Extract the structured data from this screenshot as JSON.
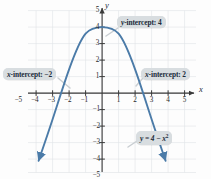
{
  "chart_data": {
    "type": "line",
    "title": "",
    "xlabel": "x",
    "ylabel": "y",
    "equation": "y = 4 − x²",
    "function": "y = 4 - x^2",
    "xlim": [
      -5.8,
      5.8
    ],
    "ylim": [
      -5.8,
      5.8
    ],
    "grid": true,
    "legend": "none",
    "x_ticks": [
      -5,
      -4,
      -3,
      -2,
      -1,
      1,
      2,
      3,
      4,
      5
    ],
    "y_ticks": [
      5,
      4,
      3,
      2,
      1,
      -1,
      -2,
      -3,
      -4,
      -5
    ],
    "x_tick_labels": [
      "−5",
      "−4",
      "−3",
      "−2",
      "−1",
      "1",
      "2",
      "3",
      "4",
      "5"
    ],
    "y_tick_labels": [
      "5",
      "4",
      "3",
      "2",
      "1",
      "−1",
      "−2",
      "−3",
      "−4",
      "−5"
    ],
    "curve_color": "#4b7ba8",
    "series": [
      {
        "name": "y = 4 - x^2",
        "x": [
          -3.1,
          -3.0,
          -2.8,
          -2.6,
          -2.4,
          -2.2,
          -2.0,
          -1.8,
          -1.6,
          -1.4,
          -1.2,
          -1.0,
          -0.8,
          -0.6,
          -0.4,
          -0.2,
          0.0,
          0.2,
          0.4,
          0.6,
          0.8,
          1.0,
          1.2,
          1.4,
          1.6,
          1.8,
          2.0,
          2.2,
          2.4,
          2.6,
          2.8,
          3.0,
          3.1
        ],
        "y": [
          -5.61,
          -5.0,
          -3.84,
          -2.76,
          -1.76,
          -0.84,
          0.0,
          0.76,
          1.44,
          2.04,
          2.56,
          3.0,
          3.36,
          3.64,
          3.84,
          3.96,
          4.0,
          3.96,
          3.84,
          3.64,
          3.36,
          3.0,
          2.56,
          2.04,
          1.44,
          0.76,
          0.0,
          -0.84,
          -1.76,
          -2.76,
          -3.84,
          -5.0,
          -5.61
        ]
      }
    ],
    "key_points": {
      "y_intercept": 4,
      "x_intercepts": [
        -2,
        2
      ],
      "vertex": [
        0,
        4
      ]
    }
  },
  "annotations": {
    "y_intercept": {
      "var": "y",
      "text": "-intercept: 4",
      "target_x": 0,
      "target_y": 4
    },
    "x_intercept_left": {
      "var": "x",
      "text": "-intercept: −2",
      "target_x": -2,
      "target_y": 0
    },
    "x_intercept_right": {
      "var": "x",
      "text": "-intercept: 2",
      "target_x": 2,
      "target_y": 0
    },
    "equation": {
      "text": "y = 4 − x",
      "exponent": "2"
    }
  },
  "axes": {
    "x_letter": "x",
    "y_letter": "y"
  }
}
